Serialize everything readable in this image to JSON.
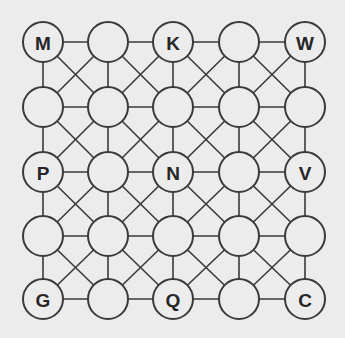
{
  "board": {
    "rows": 5,
    "cols": 5,
    "col_x": [
      43,
      108,
      173,
      239,
      305
    ],
    "row_y": [
      42,
      107,
      172,
      236,
      299
    ],
    "node_radius": 20,
    "connections": "orthogonal and both diagonals in every cell",
    "colors": {
      "background": "#ececec",
      "line": "#3a3a3a",
      "text": "#262626"
    },
    "labels": [
      [
        "M",
        "",
        "K",
        "",
        "W"
      ],
      [
        "",
        "",
        "",
        "",
        ""
      ],
      [
        "P",
        "",
        "N",
        "",
        "V"
      ],
      [
        "",
        "",
        "",
        "",
        ""
      ],
      [
        "G",
        "",
        "Q",
        "",
        "C"
      ]
    ]
  }
}
